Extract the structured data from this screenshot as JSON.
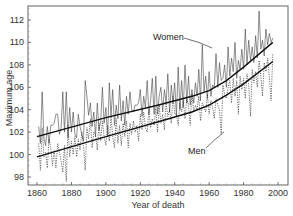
{
  "chart_data": {
    "type": "line",
    "title": "",
    "xlabel": "Year of death",
    "ylabel": "Maximum age",
    "xlim": [
      1857,
      2003
    ],
    "ylim": [
      97.3,
      113.5
    ],
    "x_ticks": [
      1860,
      1880,
      1900,
      1920,
      1940,
      1960,
      1980,
      2000
    ],
    "y_ticks": [
      98,
      100,
      102,
      104,
      106,
      108,
      110,
      112
    ],
    "grid": false,
    "legend": "none (inline annotations)",
    "annotations": [
      {
        "text": "Women",
        "target_year": 1968,
        "target_value": 109.8
      },
      {
        "text": "Men",
        "target_year": 1969,
        "target_value": 101.8
      }
    ],
    "series": [
      {
        "name": "Women",
        "style": "solid thin",
        "x": [
          1861,
          1862,
          1863,
          1864,
          1865,
          1866,
          1867,
          1868,
          1869,
          1870,
          1871,
          1872,
          1873,
          1874,
          1875,
          1876,
          1877,
          1878,
          1879,
          1880,
          1881,
          1882,
          1883,
          1884,
          1885,
          1886,
          1887,
          1888,
          1889,
          1890,
          1891,
          1892,
          1893,
          1894,
          1895,
          1896,
          1897,
          1898,
          1899,
          1900,
          1901,
          1902,
          1903,
          1904,
          1905,
          1906,
          1907,
          1908,
          1909,
          1910,
          1911,
          1912,
          1913,
          1914,
          1915,
          1916,
          1917,
          1918,
          1919,
          1920,
          1921,
          1922,
          1923,
          1924,
          1925,
          1926,
          1927,
          1928,
          1929,
          1930,
          1931,
          1932,
          1933,
          1934,
          1935,
          1936,
          1937,
          1938,
          1939,
          1940,
          1941,
          1942,
          1943,
          1944,
          1945,
          1946,
          1947,
          1948,
          1949,
          1950,
          1951,
          1952,
          1953,
          1954,
          1955,
          1956,
          1957,
          1958,
          1959,
          1960,
          1961,
          1962,
          1963,
          1964,
          1965,
          1966,
          1967,
          1968,
          1969,
          1970,
          1971,
          1972,
          1973,
          1974,
          1975,
          1976,
          1977,
          1978,
          1979,
          1980,
          1981,
          1982,
          1983,
          1984,
          1985,
          1986,
          1987,
          1988,
          1989,
          1990,
          1991,
          1992,
          1993,
          1994,
          1995,
          1996,
          1997
        ],
        "values": [
          102.5,
          101.0,
          105.6,
          101.5,
          100.8,
          102.5,
          101.0,
          102.6,
          102.6,
          102.8,
          103.6,
          103.6,
          101.8,
          102.4,
          105.6,
          102.0,
          105.6,
          101.5,
          104.2,
          102.0,
          103.8,
          101.8,
          101.5,
          103.6,
          102.5,
          101.8,
          101.2,
          106.6,
          105.2,
          103.5,
          104.6,
          102.5,
          103.8,
          101.6,
          104.6,
          102.2,
          103.0,
          106.0,
          102.8,
          104.2,
          101.6,
          106.4,
          103.4,
          105.8,
          102.6,
          104.4,
          103.2,
          106.2,
          103.0,
          104.8,
          102.6,
          105.2,
          103.6,
          105.6,
          104.0,
          103.8,
          104.4,
          104.4,
          104.6,
          105.8,
          103.4,
          105.2,
          104.2,
          106.6,
          103.6,
          104.8,
          106.8,
          103.6,
          107.0,
          103.6,
          105.2,
          106.0,
          103.8,
          105.8,
          104.6,
          107.2,
          103.8,
          106.2,
          104.6,
          106.4,
          103.4,
          107.8,
          104.0,
          106.6,
          104.2,
          108.0,
          104.6,
          107.0,
          104.4,
          105.8,
          104.6,
          106.4,
          105.2,
          107.6,
          104.8,
          109.8,
          105.6,
          107.0,
          105.0,
          107.4,
          105.2,
          106.2,
          106.0,
          109.0,
          106.0,
          108.2,
          106.6,
          106.8,
          108.0,
          106.0,
          109.6,
          107.0,
          108.6,
          107.4,
          110.0,
          106.8,
          108.4,
          107.6,
          109.4,
          107.6,
          111.2,
          108.0,
          110.2,
          108.4,
          109.6,
          108.2,
          110.6,
          108.6,
          112.8,
          109.4,
          110.2,
          108.8,
          111.2,
          109.8,
          110.8,
          110.0,
          110.4
        ]
      },
      {
        "name": "Men",
        "style": "dashed",
        "x": [
          1861,
          1862,
          1863,
          1864,
          1865,
          1866,
          1867,
          1868,
          1869,
          1870,
          1871,
          1872,
          1873,
          1874,
          1875,
          1876,
          1877,
          1878,
          1879,
          1880,
          1881,
          1882,
          1883,
          1884,
          1885,
          1886,
          1887,
          1888,
          1889,
          1890,
          1891,
          1892,
          1893,
          1894,
          1895,
          1896,
          1897,
          1898,
          1899,
          1900,
          1901,
          1902,
          1903,
          1904,
          1905,
          1906,
          1907,
          1908,
          1909,
          1910,
          1911,
          1912,
          1913,
          1914,
          1915,
          1916,
          1917,
          1918,
          1919,
          1920,
          1921,
          1922,
          1923,
          1924,
          1925,
          1926,
          1927,
          1928,
          1929,
          1930,
          1931,
          1932,
          1933,
          1934,
          1935,
          1936,
          1937,
          1938,
          1939,
          1940,
          1941,
          1942,
          1943,
          1944,
          1945,
          1946,
          1947,
          1948,
          1949,
          1950,
          1951,
          1952,
          1953,
          1954,
          1955,
          1956,
          1957,
          1958,
          1959,
          1960,
          1961,
          1962,
          1963,
          1964,
          1965,
          1966,
          1967,
          1968,
          1969,
          1970,
          1971,
          1972,
          1973,
          1974,
          1975,
          1976,
          1977,
          1978,
          1979,
          1980,
          1981,
          1982,
          1983,
          1984,
          1985,
          1986,
          1987,
          1988,
          1989,
          1990,
          1991,
          1992,
          1993,
          1994,
          1995,
          1996,
          1997
        ],
        "values": [
          101.0,
          98.6,
          102.4,
          99.8,
          100.2,
          98.8,
          101.4,
          100.6,
          99.0,
          100.4,
          98.8,
          101.0,
          100.2,
          99.4,
          98.4,
          100.8,
          97.6,
          102.6,
          99.8,
          101.2,
          100.0,
          101.6,
          99.8,
          101.4,
          100.4,
          102.0,
          100.8,
          98.6,
          102.4,
          101.4,
          103.2,
          100.6,
          102.0,
          101.8,
          100.4,
          102.8,
          101.2,
          103.0,
          101.6,
          100.8,
          102.6,
          101.2,
          103.4,
          101.6,
          100.6,
          103.2,
          101.0,
          102.6,
          100.8,
          102.8,
          101.6,
          103.0,
          100.6,
          102.8,
          101.8,
          103.0,
          102.0,
          102.6,
          101.2,
          103.6,
          102.2,
          103.8,
          102.4,
          102.0,
          104.0,
          102.4,
          103.2,
          102.6,
          104.2,
          102.0,
          104.4,
          102.8,
          103.6,
          102.2,
          104.6,
          103.4,
          104.0,
          102.8,
          105.2,
          103.6,
          103.6,
          102.6,
          104.6,
          103.8,
          104.8,
          103.2,
          105.0,
          104.4,
          102.6,
          105.4,
          103.8,
          104.4,
          104.0,
          105.2,
          103.0,
          104.6,
          104.2,
          103.8,
          105.4,
          103.6,
          104.8,
          104.2,
          103.2,
          105.0,
          104.4,
          104.0,
          101.8,
          106.2,
          105.4,
          105.0,
          106.0,
          106.6,
          104.6,
          106.8,
          105.2,
          106.6,
          103.6,
          107.0,
          105.8,
          106.8,
          105.0,
          107.2,
          106.2,
          103.4,
          107.6,
          106.4,
          107.4,
          106.0,
          108.4,
          107.0,
          105.2,
          108.2,
          107.4,
          108.6,
          106.8,
          104.8,
          109.0
        ]
      },
      {
        "name": "Women trend",
        "style": "solid thick",
        "x": [
          1860,
          1900,
          1930,
          1950,
          1960,
          1970,
          1980,
          1997
        ],
        "values": [
          101.6,
          103.3,
          104.4,
          105.2,
          105.7,
          106.6,
          107.8,
          110.0
        ]
      },
      {
        "name": "Men trend",
        "style": "solid thick",
        "x": [
          1860,
          1900,
          1930,
          1950,
          1960,
          1970,
          1980,
          1997
        ],
        "values": [
          99.8,
          101.6,
          102.9,
          103.8,
          104.4,
          105.3,
          106.3,
          108.3
        ]
      }
    ]
  },
  "labels": {
    "xlabel": "Year of death",
    "ylabel": "Maximum age",
    "women": "Women",
    "men": "Men"
  }
}
